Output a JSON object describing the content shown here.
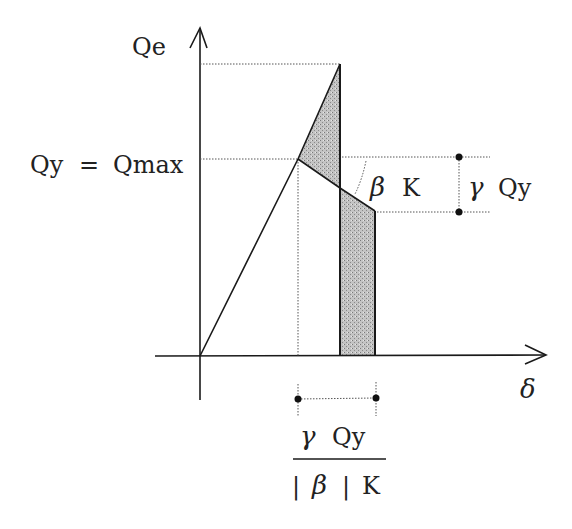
{
  "diagram": {
    "type": "load-displacement curve with degradation",
    "y_axis_label": "Qe",
    "x_axis_label": "δ",
    "yield_label_left": "Qy",
    "yield_label_eq": "=",
    "yield_label_right": "Qmax",
    "slope_label_greek": "β",
    "slope_label_k": "K",
    "drop_label_greek": "γ",
    "drop_label_q": "Qy",
    "width_numerator_greek": "γ",
    "width_numerator_q": "Qy",
    "width_denominator_bar1": "|",
    "width_denominator_greek": "β",
    "width_denominator_bar2": "|",
    "width_denominator_k": "K"
  },
  "colors": {
    "line": "#1a1a1a",
    "dotted": "#555555",
    "shade": "#b8b8b8",
    "background": "#ffffff"
  },
  "points": {
    "origin": [
      200,
      356
    ],
    "yield": [
      298,
      159
    ],
    "peak": [
      340,
      64
    ],
    "break": [
      340,
      188
    ],
    "end": [
      375,
      211
    ]
  }
}
